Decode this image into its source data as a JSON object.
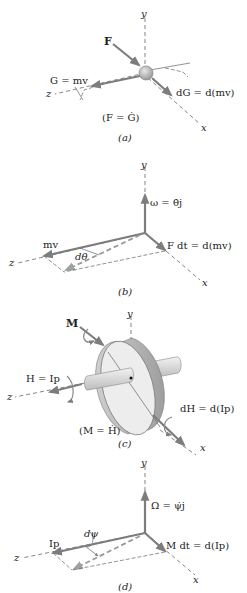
{
  "figure": {
    "panels": [
      {
        "id": "a",
        "caption": "(a)",
        "axes": {
          "x": "x",
          "y": "y",
          "z": "z"
        },
        "labels": {
          "force": "F",
          "momentum": "G = mv",
          "change": "dG = d(mv)",
          "relation": "(F = Ġ)"
        }
      },
      {
        "id": "b",
        "caption": "(b)",
        "axes": {
          "x": "x",
          "y": "y",
          "z": "z"
        },
        "labels": {
          "omega": "ω = θ̇j",
          "momentum": "mv",
          "angle": "dθ",
          "impulse": "F dt = d(mv)"
        }
      },
      {
        "id": "c",
        "caption": "(c)",
        "axes": {
          "x": "x",
          "y": "y",
          "z": "z"
        },
        "labels": {
          "moment": "M",
          "angular_momentum": "H = Ip",
          "change": "dH = d(Ip)",
          "relation": "(M = Ḣ)"
        }
      },
      {
        "id": "d",
        "caption": "(d)",
        "axes": {
          "x": "x",
          "y": "y",
          "z": "z"
        },
        "labels": {
          "omega": "Ω = ψ̇j",
          "angular_momentum": "Ip",
          "angle": "dψ",
          "impulse": "M dt = d(Ip)"
        }
      }
    ]
  }
}
